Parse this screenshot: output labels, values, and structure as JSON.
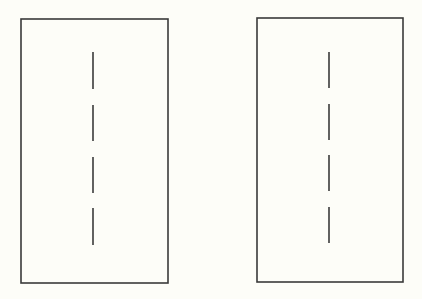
{
  "canvas": {
    "width": 422,
    "height": 299,
    "background": "#fdfdf8"
  },
  "style": {
    "stroke": "#3a3a3a",
    "rect_stroke_width": 1.6,
    "dash_stroke_width": 1.6
  },
  "panels": [
    {
      "name": "left-panel",
      "rect": {
        "x": 21,
        "y": 19,
        "w": 147,
        "h": 264
      },
      "dashed_line": {
        "x": 93,
        "segments": [
          [
            52,
            89
          ],
          [
            105,
            141
          ],
          [
            157,
            193
          ],
          [
            208,
            245
          ]
        ]
      }
    },
    {
      "name": "right-panel",
      "rect": {
        "x": 257,
        "y": 18,
        "w": 146,
        "h": 264
      },
      "dashed_line": {
        "x": 329,
        "segments": [
          [
            52,
            88
          ],
          [
            104,
            140
          ],
          [
            155,
            191
          ],
          [
            207,
            243
          ]
        ]
      }
    }
  ]
}
